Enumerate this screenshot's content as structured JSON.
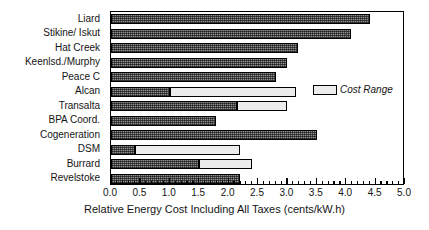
{
  "chart_data": {
    "type": "bar",
    "orientation": "horizontal",
    "title": "",
    "xlabel": "Relative Energy Cost Including All Taxes (cents/kW.h)",
    "ylabel": "",
    "xlim": [
      0.0,
      5.0
    ],
    "xtick_step": 0.5,
    "xminor_step": 0.1,
    "grid": false,
    "legend_position": "inside-right",
    "xticks": [
      "0.0",
      "0.5",
      "1.0",
      "1.5",
      "2.0",
      "2.5",
      "3.0",
      "3.5",
      "4.0",
      "4.5",
      "5.0"
    ],
    "xtick_values": [
      0.0,
      0.5,
      1.0,
      1.5,
      2.0,
      2.5,
      3.0,
      3.5,
      4.0,
      4.5,
      5.0
    ],
    "categories": [
      "Liard",
      "Stikine/ Iskut",
      "Hat Creek",
      "Keenlsd./Murphy",
      "Peace  C",
      "Alcan",
      "Transalta",
      "BPA Coord.",
      "Cogeneration",
      "DSM",
      "Burrard",
      "Revelstoke"
    ],
    "series": [
      {
        "name": "Base Cost",
        "fill": "hatched-gray",
        "values": [
          4.4,
          4.08,
          3.18,
          3.0,
          2.8,
          1.0,
          2.15,
          1.78,
          3.5,
          0.4,
          1.5,
          2.2
        ]
      },
      {
        "name": "Cost Range",
        "fill": "light-gray",
        "values": [
          null,
          null,
          null,
          null,
          null,
          3.15,
          3.0,
          null,
          null,
          2.2,
          2.4,
          null
        ]
      }
    ],
    "legend": [
      {
        "label": "Cost Range",
        "fill": "light-gray"
      }
    ],
    "colors": {
      "base_fill": "#8f8f8f",
      "range_fill": "#ececec",
      "outline": "#000000",
      "background": "#ffffff",
      "text": "#141414"
    }
  }
}
